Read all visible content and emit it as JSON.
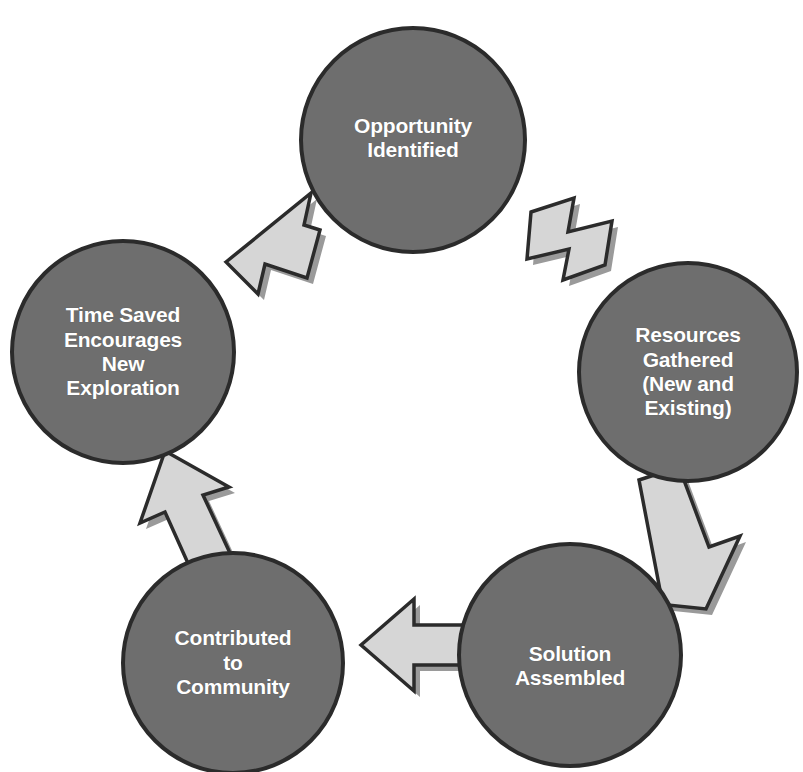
{
  "diagram": {
    "type": "cycle-diagram",
    "background_color": "#FFFFFF",
    "node_fill_color": "#6E6E6E",
    "node_border_color": "#2B2B2B",
    "node_text_color": "#FFFFFF",
    "arrow_fill_color": "#D6D6D6",
    "arrow_border_color": "#2B2B2B",
    "arrow_shadow_color": "#9A9A9A",
    "direction": "clockwise",
    "nodes": [
      {
        "id": "opportunity-identified",
        "label": "Opportunity\nIdentified",
        "order": 1,
        "cx": 413,
        "cy": 140,
        "r": 114,
        "font_size": 21
      },
      {
        "id": "resources-gathered",
        "label": "Resources\nGathered\n(New and\nExisting)",
        "order": 2,
        "cx": 688,
        "cy": 372,
        "r": 110,
        "font_size": 21
      },
      {
        "id": "solution-assembled",
        "label": "Solution\nAssembled",
        "order": 3,
        "cx": 570,
        "cy": 655,
        "r": 112,
        "font_size": 21
      },
      {
        "id": "contributed-to-community",
        "label": "Contributed\nto\nCommunity",
        "order": 4,
        "cx": 233,
        "cy": 663,
        "r": 111,
        "font_size": 21
      },
      {
        "id": "time-saved-encourages-new-exploration",
        "label": "Time Saved\nEncourages\nNew\nExploration",
        "order": 5,
        "cx": 123,
        "cy": 352,
        "r": 112,
        "font_size": 21
      }
    ],
    "arrows": [
      {
        "id": "arrow-opportunity-to-resources",
        "from": "opportunity-identified",
        "to": "resources-gathered",
        "direction": "down-right"
      },
      {
        "id": "arrow-resources-to-solution",
        "from": "resources-gathered",
        "to": "solution-assembled",
        "direction": "down-left"
      },
      {
        "id": "arrow-solution-to-contributed",
        "from": "solution-assembled",
        "to": "contributed-to-community",
        "direction": "left"
      },
      {
        "id": "arrow-contributed-to-time-saved",
        "from": "contributed-to-community",
        "to": "time-saved-encourages-new-exploration",
        "direction": "up"
      },
      {
        "id": "arrow-time-saved-to-opportunity",
        "from": "time-saved-encourages-new-exploration",
        "to": "opportunity-identified",
        "direction": "up-right"
      }
    ]
  }
}
